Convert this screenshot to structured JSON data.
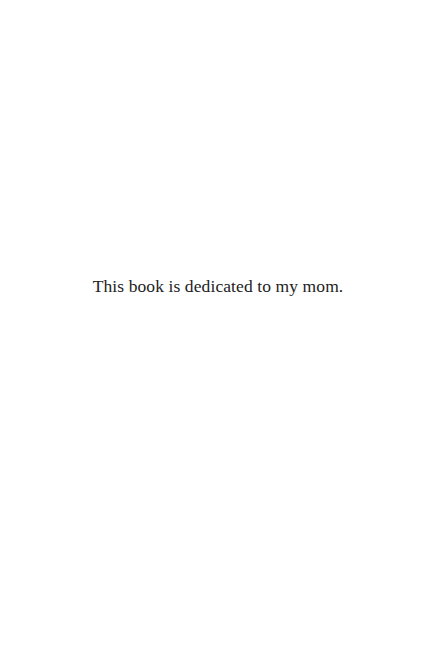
{
  "page": {
    "type": "dedication",
    "background_color": "#ffffff",
    "text_color": "#222222"
  },
  "dedication": {
    "text": "This book is dedicated to my mom."
  }
}
